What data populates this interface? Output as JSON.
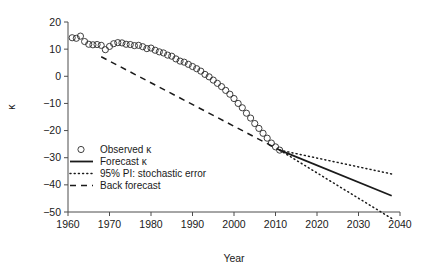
{
  "chart_data": {
    "type": "line",
    "title": "",
    "xlabel": "Year",
    "ylabel": "κ",
    "xlim": [
      1960,
      2040
    ],
    "ylim": [
      -55,
      20
    ],
    "xticks": [
      1960,
      1970,
      1980,
      1990,
      2000,
      2010,
      2020,
      2030,
      2040
    ],
    "xtick_labels": [
      "1960",
      "1970",
      "1980",
      "1990",
      "2000",
      "2010",
      "2020",
      "2030",
      "2040"
    ],
    "yticks": [
      20,
      10,
      0,
      -10,
      -20,
      -30,
      -40,
      -50
    ],
    "ytick_labels": [
      "20",
      "10",
      "0",
      "−10",
      "−20",
      "−30",
      "−40",
      "−50"
    ],
    "grid": false,
    "legend_position": "lower left",
    "legend": [
      {
        "label": "Observed κ",
        "marker": "circle-open",
        "style": "none"
      },
      {
        "label": "Forecast κ",
        "marker": "none",
        "style": "solid"
      },
      {
        "label": "95% PI: stochastic error",
        "marker": "none",
        "style": "dotted"
      },
      {
        "label": "Back forecast",
        "marker": "none",
        "style": "dashed"
      }
    ],
    "series": [
      {
        "name": "Observed κ",
        "style": "circle-open",
        "x": [
          1961,
          1962,
          1963,
          1964,
          1965,
          1966,
          1967,
          1968,
          1969,
          1970,
          1971,
          1972,
          1973,
          1974,
          1975,
          1976,
          1977,
          1978,
          1979,
          1980,
          1981,
          1982,
          1983,
          1984,
          1985,
          1986,
          1987,
          1988,
          1989,
          1990,
          1991,
          1992,
          1993,
          1994,
          1995,
          1996,
          1997,
          1998,
          1999,
          2000,
          2001,
          2002,
          2003,
          2004,
          2005,
          2006,
          2007,
          2008,
          2009,
          2010,
          2011
        ],
        "values": [
          14.2,
          14.0,
          14.8,
          12.8,
          11.8,
          11.6,
          11.7,
          11.4,
          9.8,
          11.0,
          12.0,
          12.4,
          12.3,
          11.8,
          11.7,
          11.3,
          11.4,
          10.9,
          10.2,
          10.4,
          9.6,
          9.0,
          8.6,
          7.8,
          7.4,
          6.4,
          5.6,
          5.2,
          4.4,
          3.6,
          2.8,
          1.9,
          0.7,
          -0.2,
          -1.4,
          -2.6,
          -3.8,
          -5.2,
          -6.6,
          -8.2,
          -10.0,
          -11.6,
          -13.6,
          -15.4,
          -17.4,
          -19.2,
          -21.0,
          -22.8,
          -24.6,
          -26.0,
          -27.2
        ]
      },
      {
        "name": "Forecast κ",
        "style": "solid",
        "x": [
          2011,
          2038
        ],
        "values": [
          -27.2,
          -44.0
        ]
      },
      {
        "name": "95% PI upper",
        "style": "dotted",
        "x": [
          2011,
          2038
        ],
        "values": [
          -27.2,
          -36.0
        ]
      },
      {
        "name": "95% PI lower",
        "style": "dotted",
        "x": [
          2011,
          2038
        ],
        "values": [
          -27.2,
          -52.4
        ]
      },
      {
        "name": "Back forecast",
        "style": "dashed",
        "x": [
          1968,
          2011
        ],
        "values": [
          7.2,
          -27.2
        ]
      }
    ]
  }
}
